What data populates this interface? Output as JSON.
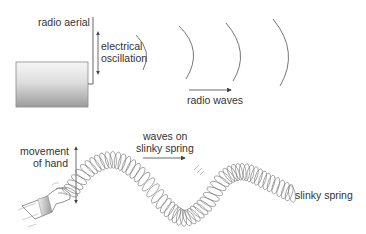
{
  "top_diagram": {
    "labels": {
      "aerial": "radio aerial",
      "oscillation_line1": "electrical",
      "oscillation_line2": "oscillation",
      "waves": "radio waves"
    }
  },
  "bottom_diagram": {
    "labels": {
      "hand_line1": "movement",
      "hand_line2": "of hand",
      "waves_line1": "waves on",
      "waves_line2": "slinky spring",
      "spring": "slinky spring"
    }
  },
  "colors": {
    "line": "#555555",
    "text": "#333333",
    "box_top": "#f4f4f4",
    "box_bottom": "#9a9a9a"
  }
}
